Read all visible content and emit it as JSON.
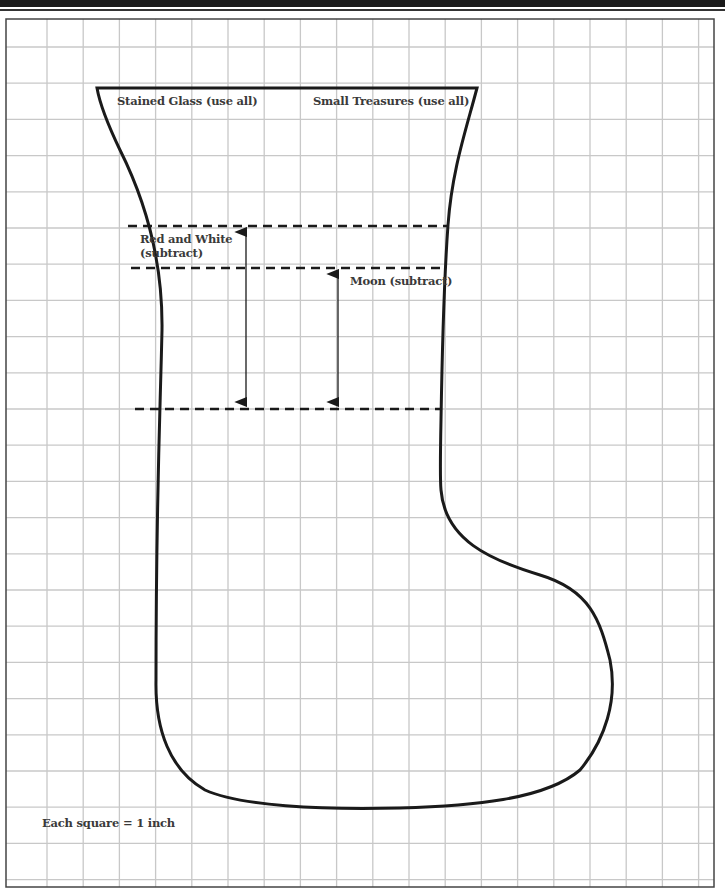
{
  "labels": {
    "stained_glass": "Stained Glass (use all)",
    "small_treasures": "Small Treasures (use all)",
    "red_and_white_line1": "Red and White",
    "red_and_white_line2": "(subtract)",
    "moon": "Moon (subtract)",
    "scale_note": "Each square = 1 inch"
  },
  "grid": {
    "unit": "1 inch",
    "columns": 20,
    "rows": 24,
    "line_color": "#c8c8c8"
  },
  "colors": {
    "outline": "#1a1a1a",
    "dashed": "#1a1a1a",
    "frame": "#444444"
  }
}
